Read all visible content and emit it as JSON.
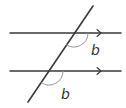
{
  "diagram": {
    "type": "parallel-lines-transversal",
    "parallel_lines": [
      {
        "id": "top",
        "x1": 10,
        "y1": 33,
        "x2": 121,
        "y2": 33,
        "arrow_x": 100
      },
      {
        "id": "bottom",
        "x1": 10,
        "y1": 71,
        "x2": 121,
        "y2": 71,
        "arrow_x": 100
      }
    ],
    "transversal": {
      "x1": 93,
      "y1": 6,
      "x2": 28,
      "y2": 102
    },
    "angles": [
      {
        "id": "upper",
        "label": "b",
        "vertex": [
          74,
          33
        ],
        "radius": 14,
        "label_pos": [
          96,
          50
        ]
      },
      {
        "id": "lower",
        "label": "b",
        "vertex": [
          49,
          71
        ],
        "radius": 14,
        "label_pos": [
          66,
          94
        ]
      }
    ],
    "colors": {
      "line": "#3a3a3a",
      "arc": "#9a9a9a",
      "label": "#333333",
      "background": "#ffffff"
    }
  }
}
